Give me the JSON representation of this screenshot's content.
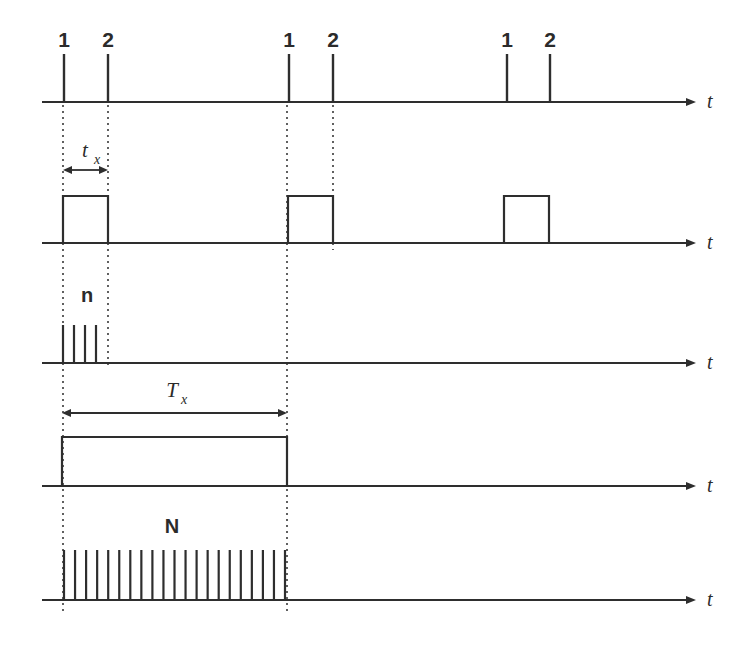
{
  "figure": {
    "type": "timing-diagram",
    "title": "",
    "background_color": "#ffffff",
    "ink_color": "#2e2e2e",
    "width": 748,
    "height": 649
  },
  "axis_label": "t",
  "labels": {
    "pulse_1": "1",
    "pulse_2": "2",
    "t_x_symbol": "t",
    "t_x_subscript": "x",
    "T_x_symbol": "T",
    "T_x_subscript": "x",
    "n_count": "n",
    "N_count": "N"
  },
  "chart_data": {
    "type": "line",
    "title": "",
    "xlabel": "t",
    "ylabel": "",
    "grid": false,
    "legend": null,
    "axis_start_x": 42,
    "axis_end_x": 690,
    "arrow_tip_x": 696,
    "axis_label_x": 707,
    "rows": [
      {
        "name": "trigger-pulses",
        "baseline_y": 102,
        "kind": "impulses",
        "impulse_height": 48,
        "impulses": [
          {
            "x": 64,
            "label": "1"
          },
          {
            "x": 108,
            "label": "2"
          },
          {
            "x": 289,
            "label": "1"
          },
          {
            "x": 333,
            "label": "2"
          },
          {
            "x": 507,
            "label": "1"
          },
          {
            "x": 550,
            "label": "2"
          }
        ],
        "label_y": 47
      },
      {
        "name": "gate-pulse-tx",
        "baseline_y": 243,
        "kind": "rect-pulses",
        "pulse_height": 47,
        "pulses": [
          {
            "start_x": 63,
            "end_x": 108
          },
          {
            "start_x": 288,
            "end_x": 333
          },
          {
            "start_x": 504,
            "end_x": 549
          }
        ],
        "dimension": {
          "label_symbol": "t",
          "label_subscript": "x",
          "label_x": 85,
          "label_y": 157,
          "line_y": 170,
          "from_x": 63,
          "to_x": 108
        }
      },
      {
        "name": "burst-n",
        "baseline_y": 363,
        "kind": "pulse-train",
        "train_height": 38,
        "train_start_x": 63,
        "train_end_x": 96,
        "train_count": 4,
        "count_label": "n",
        "count_label_x": 87,
        "count_label_y": 302
      },
      {
        "name": "gate-pulse-Tx",
        "baseline_y": 486,
        "kind": "rect-pulses",
        "pulse_height": 49,
        "pulses": [
          {
            "start_x": 62,
            "end_x": 287
          }
        ],
        "dimension": {
          "label_symbol": "T",
          "label_subscript": "x",
          "label_x": 172,
          "label_y": 397,
          "line_y": 413,
          "from_x": 62,
          "to_x": 287
        }
      },
      {
        "name": "burst-N",
        "baseline_y": 600,
        "kind": "pulse-train",
        "train_height": 50,
        "train_start_x": 64,
        "train_end_x": 285,
        "train_count": 21,
        "count_label": "N",
        "count_label_x": 172,
        "count_label_y": 533
      }
    ],
    "guides": [
      {
        "x": 63,
        "y_from": 105,
        "y_to": 615
      },
      {
        "x": 108,
        "y_from": 105,
        "y_to": 368
      },
      {
        "x": 287,
        "y_from": 105,
        "y_to": 615
      },
      {
        "x": 333,
        "y_from": 105,
        "y_to": 250
      }
    ]
  }
}
